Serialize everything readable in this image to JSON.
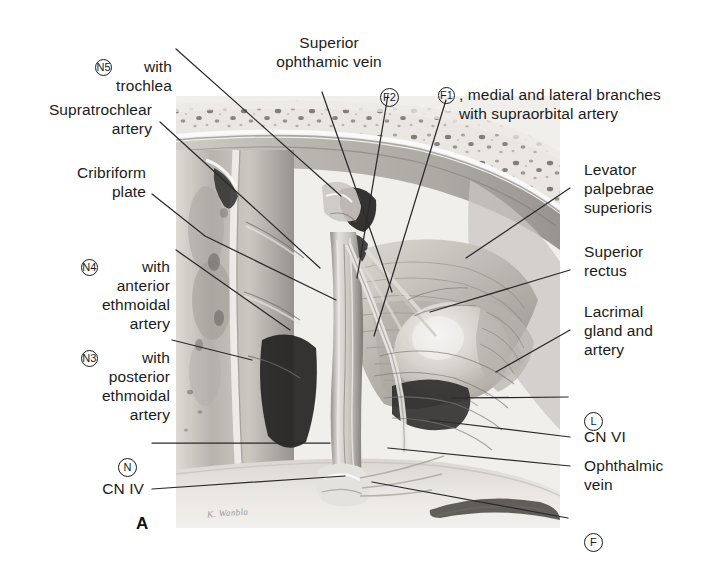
{
  "figure": {
    "letter": "A",
    "signature": "K. Wanbla",
    "width": 726,
    "height": 568
  },
  "colors": {
    "text": "#1b1b1b",
    "leader_line": "#2a2a2a",
    "background": "#ffffff",
    "bone_light": "#ece9e4",
    "bone_mid": "#c9c5bf",
    "tissue_mid": "#b9b5b0",
    "tissue_dark": "#6e6a66",
    "shadow": "#2e2c2a",
    "highlight": "#f4f2ef"
  },
  "labels": {
    "cn5_trochlea": {
      "code": "N5",
      "text": "with\ntrochlea"
    },
    "supratrochlear_artery": {
      "text": "Supratrochlear\nartery"
    },
    "cribriform_plate": {
      "text": "Cribriform\nplate"
    },
    "cn4_anterior_ethmoidal": {
      "code": "N4",
      "text": "with\nanterior\nethmoidal\nartery"
    },
    "cn3_posterior_ethmoidal": {
      "code": "N3",
      "text": "with\nposterior\nethmoidal\nartery"
    },
    "n_nasociliary": {
      "code": "N",
      "text": ""
    },
    "cn_iv": {
      "text": "CN IV"
    },
    "superior_ophthalmic_vein": {
      "text": "Superior\nophthamic vein"
    },
    "f2_frontal": {
      "code": "F2",
      "text": ""
    },
    "f1_supraorbital": {
      "code": "F1",
      "text": ", medial and lateral branches\nwith supraorbital artery"
    },
    "levator_palpebrae": {
      "text": "Levator\npalpebrae\nsuperioris"
    },
    "superior_rectus": {
      "text": "Superior\nrectus"
    },
    "lacrimal_gland": {
      "text": "Lacrimal\ngland and\nartery"
    },
    "l_lacrimal": {
      "code": "L",
      "text": ""
    },
    "cn_vi": {
      "text": "CN VI"
    },
    "ophthalmic_vein": {
      "text": "Ophthalmic\nvein"
    },
    "f_frontal": {
      "code": "F",
      "text": ""
    }
  }
}
